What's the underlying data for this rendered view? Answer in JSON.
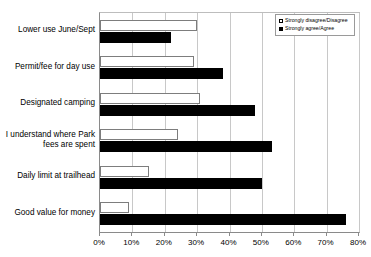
{
  "chart_data": {
    "type": "bar",
    "orientation": "horizontal",
    "title": "",
    "subtitle": "",
    "xlabel": "",
    "ylabel": "",
    "xlim": [
      0,
      80
    ],
    "xtick_labels": [
      "0%",
      "10%",
      "20%",
      "30%",
      "40%",
      "50%",
      "60%",
      "70%",
      "80%"
    ],
    "xtick_values": [
      0,
      10,
      20,
      30,
      40,
      50,
      60,
      70,
      80
    ],
    "grid": true,
    "legend_position": "top-right-inside",
    "categories": [
      "Lower use June/Sept",
      "Permit/fee for day use",
      "Designated camping",
      "I understand where Park\nfees are spent",
      "Daily limit at trailhead",
      "Good value for money"
    ],
    "series": [
      {
        "name": "Strongly disagree/Disagree",
        "color": "#ffffff",
        "edge_color": "#7d7d7d",
        "marker": "hollow-square",
        "values": [
          30,
          29,
          31,
          24,
          15,
          9
        ]
      },
      {
        "name": "Strongly agree/Agree",
        "color": "#000000",
        "edge_color": "#000000",
        "marker": "filled-square",
        "values": [
          22,
          38,
          48,
          53,
          50,
          76
        ]
      }
    ]
  },
  "legend": {
    "entries": [
      {
        "label": "Strongly disagree/Disagree"
      },
      {
        "label": "Strongly agree/Agree"
      }
    ]
  }
}
